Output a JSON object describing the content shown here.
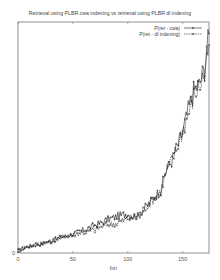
{
  "chart_data": {
    "type": "line",
    "title": "Retrieval using PLBR cwa indexing vs retrieval using PLBR dl indexing",
    "xlabel": "bin",
    "ylabel": "",
    "xlim": [
      0,
      174
    ],
    "ylim": [
      0,
      1
    ],
    "x_ticks": [
      "0",
      "50",
      "100",
      "150"
    ],
    "y_ticks": [
      "0"
    ],
    "grid": false,
    "legend_position": "top-right",
    "x": [
      0,
      10,
      20,
      30,
      40,
      50,
      60,
      70,
      80,
      90,
      100,
      105,
      110,
      115,
      120,
      125,
      130,
      135,
      140,
      145,
      150,
      155,
      160,
      165,
      170,
      174
    ],
    "series": [
      {
        "name": "P(ret - cwa)",
        "style": "solid",
        "marker": "+",
        "values": [
          0.01,
          0.03,
          0.04,
          0.05,
          0.07,
          0.08,
          0.1,
          0.12,
          0.14,
          0.16,
          0.17,
          0.16,
          0.16,
          0.19,
          0.22,
          0.25,
          0.27,
          0.36,
          0.4,
          0.46,
          0.52,
          0.62,
          0.7,
          0.73,
          0.8,
          0.95
        ]
      },
      {
        "name": "P(ret - dl indexing)",
        "style": "dashed",
        "marker": "x",
        "values": [
          0.01,
          0.03,
          0.04,
          0.05,
          0.07,
          0.08,
          0.09,
          0.1,
          0.12,
          0.13,
          0.15,
          0.15,
          0.17,
          0.19,
          0.22,
          0.24,
          0.27,
          0.35,
          0.4,
          0.46,
          0.53,
          0.6,
          0.68,
          0.72,
          0.78,
          0.9
        ]
      }
    ]
  }
}
